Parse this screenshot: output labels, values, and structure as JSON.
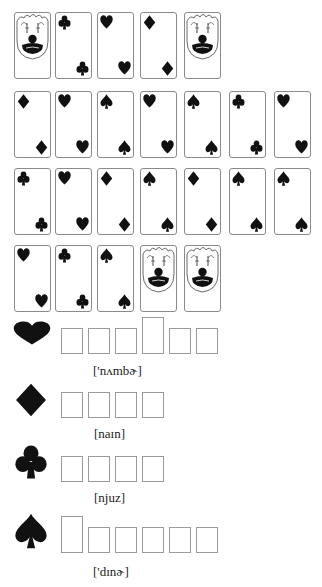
{
  "puzzle": {
    "card_rows": [
      [
        {
          "type": "joker"
        },
        {
          "type": "letter",
          "letter": "w",
          "suit": "club"
        },
        {
          "type": "letter",
          "letter": "u",
          "suit": "heart"
        },
        {
          "type": "letter",
          "letter": "i",
          "suit": "diamond"
        },
        {
          "type": "joker"
        }
      ],
      [
        {
          "type": "letter",
          "letter": "n",
          "suit": "diamond"
        },
        {
          "type": "letter",
          "letter": "r",
          "suit": "heart"
        },
        {
          "type": "letter",
          "letter": "d",
          "suit": "spade"
        },
        {
          "type": "letter",
          "letter": "n",
          "suit": "heart"
        },
        {
          "type": "letter",
          "letter": "e",
          "suit": "spade"
        },
        {
          "type": "letter",
          "letter": "e",
          "suit": "club"
        },
        {
          "type": "letter",
          "letter": "m",
          "suit": "heart"
        }
      ],
      [
        {
          "type": "letter",
          "letter": "s",
          "suit": "club"
        },
        {
          "type": "letter",
          "letter": "e",
          "suit": "heart"
        },
        {
          "type": "letter",
          "letter": "e",
          "suit": "diamond"
        },
        {
          "type": "letter",
          "letter": "i",
          "suit": "spade"
        },
        {
          "type": "letter",
          "letter": "n",
          "suit": "diamond"
        },
        {
          "type": "letter",
          "letter": "r",
          "suit": "spade"
        },
        {
          "type": "letter",
          "letter": "n",
          "suit": "spade"
        }
      ],
      [
        {
          "type": "letter",
          "letter": "b",
          "suit": "heart"
        },
        {
          "type": "letter",
          "letter": "n",
          "suit": "club"
        },
        {
          "type": "letter",
          "letter": "n",
          "suit": "spade"
        },
        {
          "type": "joker"
        },
        {
          "type": "joker"
        }
      ]
    ],
    "answers": [
      {
        "suit": "heart",
        "boxes": [
          "short",
          "short",
          "short",
          "tall",
          "short",
          "short"
        ],
        "phonetic": "['nʌmbɚ]"
      },
      {
        "suit": "diamond",
        "boxes": [
          "short",
          "short",
          "short",
          "short"
        ],
        "phonetic": "[naɪn]"
      },
      {
        "suit": "club",
        "boxes": [
          "short",
          "short",
          "short",
          "short"
        ],
        "phonetic": "[njuz]"
      },
      {
        "suit": "spade",
        "boxes": [
          "tall",
          "short",
          "short",
          "short",
          "short",
          "short"
        ],
        "phonetic": "['dɪnɚ]"
      }
    ]
  },
  "colors": {
    "ink": "#111111",
    "box_border": "#9a9a9a",
    "card_border": "#8a8a8a"
  }
}
